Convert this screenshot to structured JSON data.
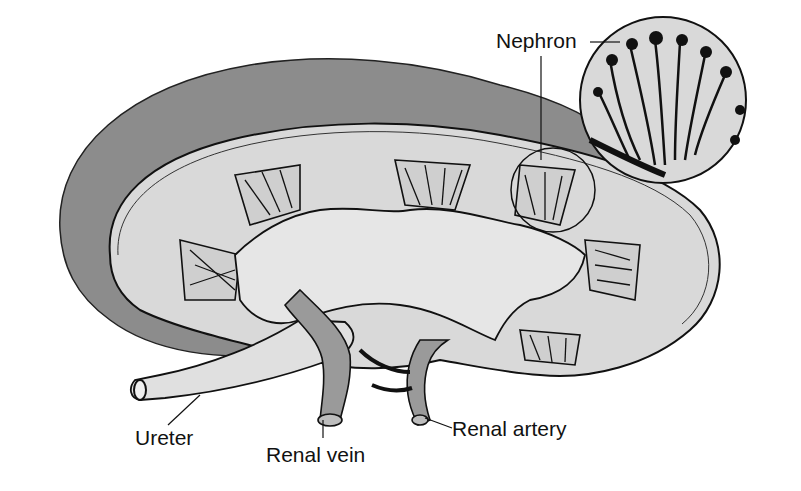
{
  "diagram": {
    "labels": {
      "nephron": "Nephron",
      "ureter": "Ureter",
      "renal_vein": "Renal vein",
      "renal_artery": "Renal artery"
    },
    "colors": {
      "capsule_shadow": "#8c8c8c",
      "cortex": "#d9d9d9",
      "pelvis": "#e6e6e6",
      "vessel": "#9a9a9a",
      "ink": "#111111",
      "background": "#ffffff"
    }
  }
}
